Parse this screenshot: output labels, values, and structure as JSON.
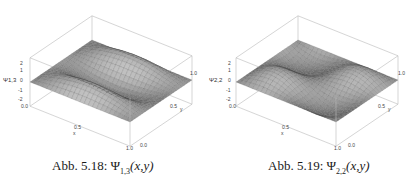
{
  "figures": [
    {
      "id": "fig-5-18",
      "caption_prefix": "Abb. 5.18: ",
      "caption_symbol": "Ψ",
      "caption_subscript": "1,3",
      "caption_args": "(x,y)",
      "zaxis_label": "Ψ1,3",
      "z_ticks": [
        "2",
        "1",
        "0",
        "-1",
        "-2"
      ],
      "x_ticks": [
        "0.0",
        "0.5",
        "1.0"
      ],
      "x_label": "x",
      "y_ticks": [
        "0.0",
        "0.5",
        "1.0"
      ],
      "y_label": "y"
    },
    {
      "id": "fig-5-19",
      "caption_prefix": "Abb. 5.19: ",
      "caption_symbol": "Ψ",
      "caption_subscript": "2,2",
      "caption_args": "(x,y)",
      "zaxis_label": "Ψ2,2",
      "z_ticks": [
        "2",
        "1",
        "0",
        "-1",
        "-2"
      ],
      "x_ticks": [
        "0.0",
        "0.5",
        "1.0"
      ],
      "x_label": "x",
      "y_ticks": [
        "0.0",
        "0.5",
        "1.0"
      ],
      "y_label": "y"
    }
  ],
  "chart_data": [
    {
      "type": "surface",
      "title": "Abb. 5.18: Ψ1,3(x,y)",
      "function": "Ψ1,3(x,y) ∝ sin(πx)·sin(3πy)",
      "xlabel": "x",
      "ylabel": "y",
      "zlabel": "Ψ1,3",
      "xlim": [
        0,
        1
      ],
      "ylim": [
        0,
        1
      ],
      "zlim": [
        -2,
        2
      ],
      "x_ticks": [
        0.0,
        0.5,
        1.0
      ],
      "y_ticks": [
        0.0,
        0.5,
        1.0
      ],
      "z_ticks": [
        -2,
        -1,
        0,
        1,
        2
      ]
    },
    {
      "type": "surface",
      "title": "Abb. 5.19: Ψ2,2(x,y)",
      "function": "Ψ2,2(x,y) ∝ sin(2πx)·sin(2πy)",
      "xlabel": "x",
      "ylabel": "y",
      "zlabel": "Ψ2,2",
      "xlim": [
        0,
        1
      ],
      "ylim": [
        0,
        1
      ],
      "zlim": [
        -2,
        2
      ],
      "x_ticks": [
        0.0,
        0.5,
        1.0
      ],
      "y_ticks": [
        0.0,
        0.5,
        1.0
      ],
      "z_ticks": [
        -2,
        -1,
        0,
        1,
        2
      ]
    }
  ]
}
